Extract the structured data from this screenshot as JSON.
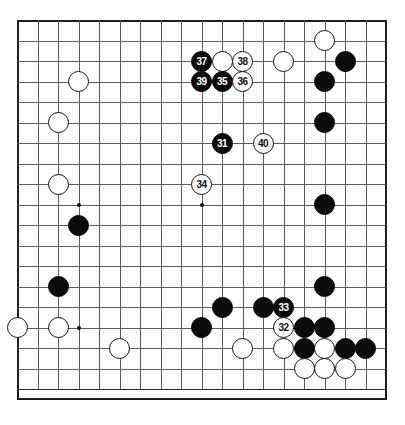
{
  "diagram": {
    "board_size": 19,
    "move_range": "31-40",
    "colors": {
      "black_stone": "#0b0b0b",
      "white_stone": "#ffffff",
      "grid_line": "#5a5a5a",
      "board_border": "#1a1a1a",
      "background": "#ffffff",
      "black_label_text": "#ffffff",
      "white_label_text": "#111111"
    },
    "geometry": {
      "origin_x": 17,
      "origin_y": 20,
      "spacing": 20.5,
      "stone_diameter": 21
    },
    "star_points": [
      {
        "col": 3,
        "row": 3
      },
      {
        "col": 9,
        "row": 3
      },
      {
        "col": 15,
        "row": 3
      },
      {
        "col": 3,
        "row": 9
      },
      {
        "col": 9,
        "row": 9
      },
      {
        "col": 15,
        "row": 9
      },
      {
        "col": 3,
        "row": 15
      },
      {
        "col": 9,
        "row": 15
      },
      {
        "col": 15,
        "row": 15
      }
    ],
    "stones": [
      {
        "col": 15,
        "row": 1,
        "color": "white",
        "label": ""
      },
      {
        "col": 9,
        "row": 2,
        "color": "black",
        "label": "37"
      },
      {
        "col": 10,
        "row": 2,
        "color": "white",
        "label": ""
      },
      {
        "col": 11,
        "row": 2,
        "color": "white",
        "label": "38"
      },
      {
        "col": 13,
        "row": 2,
        "color": "white",
        "label": ""
      },
      {
        "col": 16,
        "row": 2,
        "color": "black",
        "label": ""
      },
      {
        "col": 3,
        "row": 3,
        "color": "white",
        "label": ""
      },
      {
        "col": 9,
        "row": 3,
        "color": "black",
        "label": "39"
      },
      {
        "col": 10,
        "row": 3,
        "color": "black",
        "label": "35"
      },
      {
        "col": 11,
        "row": 3,
        "color": "white",
        "label": "36"
      },
      {
        "col": 15,
        "row": 3,
        "color": "black",
        "label": ""
      },
      {
        "col": 2,
        "row": 5,
        "color": "white",
        "label": ""
      },
      {
        "col": 15,
        "row": 5,
        "color": "black",
        "label": ""
      },
      {
        "col": 10,
        "row": 6,
        "color": "black",
        "label": "31"
      },
      {
        "col": 12,
        "row": 6,
        "color": "white",
        "label": "40"
      },
      {
        "col": 2,
        "row": 8,
        "color": "white",
        "label": ""
      },
      {
        "col": 9,
        "row": 8,
        "color": "white",
        "label": "34"
      },
      {
        "col": 15,
        "row": 9,
        "color": "black",
        "label": ""
      },
      {
        "col": 3,
        "row": 10,
        "color": "black",
        "label": ""
      },
      {
        "col": 2,
        "row": 13,
        "color": "black",
        "label": ""
      },
      {
        "col": 15,
        "row": 13,
        "color": "black",
        "label": ""
      },
      {
        "col": 10,
        "row": 14,
        "color": "black",
        "label": ""
      },
      {
        "col": 12,
        "row": 14,
        "color": "black",
        "label": ""
      },
      {
        "col": 13,
        "row": 14,
        "color": "black",
        "label": "33"
      },
      {
        "col": 0,
        "row": 15,
        "color": "white",
        "label": ""
      },
      {
        "col": 2,
        "row": 15,
        "color": "white",
        "label": ""
      },
      {
        "col": 9,
        "row": 15,
        "color": "black",
        "label": ""
      },
      {
        "col": 13,
        "row": 15,
        "color": "white",
        "label": "32"
      },
      {
        "col": 14,
        "row": 15,
        "color": "black",
        "label": ""
      },
      {
        "col": 15,
        "row": 15,
        "color": "black",
        "label": ""
      },
      {
        "col": 5,
        "row": 16,
        "color": "white",
        "label": ""
      },
      {
        "col": 11,
        "row": 16,
        "color": "white",
        "label": ""
      },
      {
        "col": 13,
        "row": 16,
        "color": "white",
        "label": ""
      },
      {
        "col": 14,
        "row": 16,
        "color": "black",
        "label": ""
      },
      {
        "col": 15,
        "row": 16,
        "color": "white",
        "label": ""
      },
      {
        "col": 16,
        "row": 16,
        "color": "black",
        "label": ""
      },
      {
        "col": 17,
        "row": 16,
        "color": "black",
        "label": ""
      },
      {
        "col": 14,
        "row": 17,
        "color": "white",
        "label": ""
      },
      {
        "col": 15,
        "row": 17,
        "color": "white",
        "label": ""
      },
      {
        "col": 16,
        "row": 17,
        "color": "white",
        "label": ""
      }
    ]
  }
}
